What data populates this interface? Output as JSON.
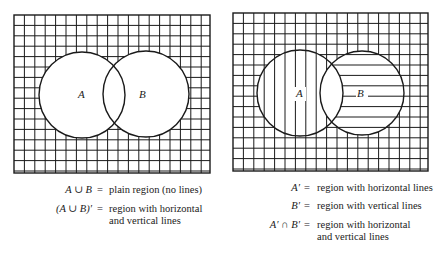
{
  "figures": [
    {
      "id": "left",
      "box": {
        "x": 14,
        "y": 15,
        "w": 196,
        "h": 158
      },
      "grid_spacing": 10.4,
      "circle_a": {
        "cx": 82,
        "cy": 95,
        "r": 43,
        "label": "A"
      },
      "circle_b": {
        "cx": 146,
        "cy": 94,
        "r": 43,
        "label": "B"
      },
      "captions": [
        {
          "lhs": "A ∪ B",
          "eq": "=",
          "rhs": [
            "plain region (no lines)"
          ]
        },
        {
          "lhs": "(A ∪ B)′",
          "eq": "=",
          "rhs": [
            "region with horizontal",
            "and vertical lines"
          ]
        }
      ]
    },
    {
      "id": "right",
      "box": {
        "x": 233,
        "y": 13,
        "w": 195,
        "h": 158
      },
      "grid_spacing": 10.4,
      "circle_a": {
        "cx": 300,
        "cy": 93,
        "r": 43,
        "label": "A"
      },
      "circle_b": {
        "cx": 362,
        "cy": 93,
        "r": 42,
        "label": "B"
      },
      "captions": [
        {
          "lhs": "A′",
          "eq": "=",
          "rhs": [
            "region with horizontal lines"
          ]
        },
        {
          "lhs": "B′",
          "eq": "=",
          "rhs": [
            "region with vertical lines"
          ]
        },
        {
          "lhs": "A′ ∩ B′",
          "eq": "=",
          "rhs": [
            "region with horizontal",
            "and vertical lines"
          ]
        }
      ]
    }
  ],
  "colors": {
    "ink": "#1a1a1a",
    "background": "#ffffff"
  }
}
